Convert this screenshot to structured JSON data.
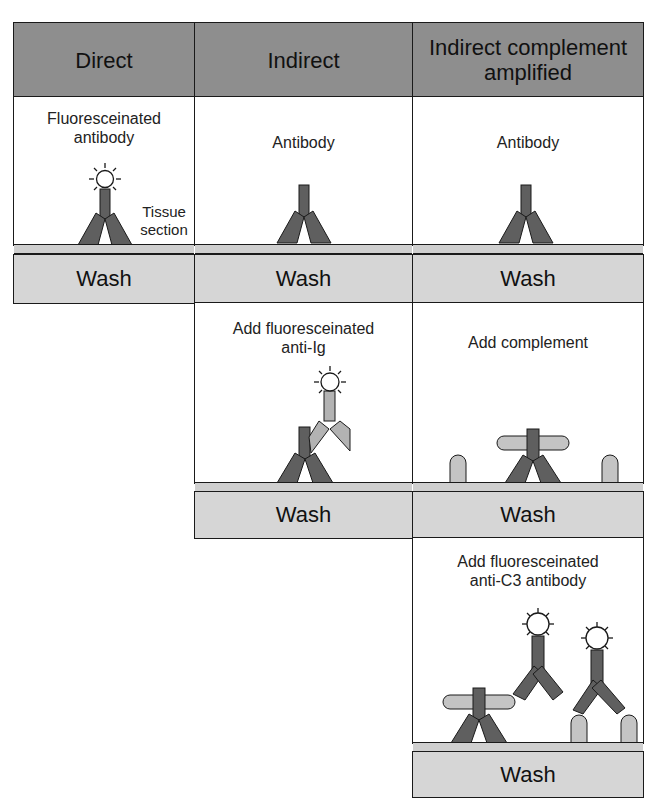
{
  "columns": [
    {
      "id": "direct",
      "header": "Direct",
      "steps": [
        {
          "caption_line1": "Fluoresceinated",
          "caption_line2": "antibody",
          "side_label_line1": "Tissue",
          "side_label_line2": "section",
          "wash_label": "Wash"
        }
      ]
    },
    {
      "id": "indirect",
      "header": "Indirect",
      "steps": [
        {
          "caption_line1": "Antibody",
          "wash_label": "Wash"
        },
        {
          "caption_line1": "Add fluoresceinated",
          "caption_line2": "anti-Ig",
          "wash_label": "Wash"
        }
      ]
    },
    {
      "id": "indirect-complement-amplified",
      "header_line1": "Indirect complement",
      "header_line2": "amplified",
      "steps": [
        {
          "caption_line1": "Antibody",
          "wash_label": "Wash"
        },
        {
          "caption_line1": "Add complement",
          "wash_label": "Wash"
        },
        {
          "caption_line1": "Add fluoresceinated",
          "caption_line2": "anti-C3 antibody",
          "wash_label": "Wash"
        }
      ]
    }
  ],
  "colors": {
    "header_fill": "#8e8e8e",
    "wash_fill": "#d6d6d6",
    "tissue_fill": "#cfcfcf",
    "primary_antibody": "#5f5f5f",
    "secondary_antibody": "#b3b3b3",
    "complement": "#c4c4c4",
    "fluorophore": "#ffffff",
    "outline": "#1a1a1a"
  },
  "icons": {
    "primary_antibody": "antibody-icon",
    "secondary_antibody": "anti-ig-antibody-icon",
    "fluorophore": "fluorescein-glow-icon",
    "complement": "complement-c3-icon"
  }
}
